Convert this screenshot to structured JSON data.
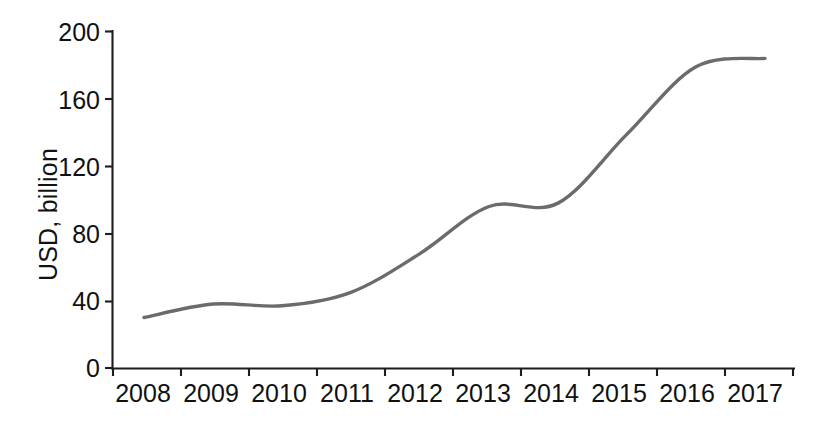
{
  "chart_data": {
    "type": "line",
    "title": "",
    "subtitle": "",
    "xlabel": "",
    "ylabel": "USD, billion",
    "categories": [
      "2008",
      "2009",
      "2010",
      "2011",
      "2012",
      "2013",
      "2014",
      "2015",
      "2016",
      "2017"
    ],
    "x": [
      2008,
      2009,
      2010,
      2011,
      2012,
      2013,
      2014,
      2015,
      2016,
      2017
    ],
    "values": [
      30,
      38,
      37,
      45,
      68,
      96,
      98,
      139,
      179,
      184
    ],
    "series": [
      {
        "name": "USD, billion",
        "values": [
          30,
          38,
          37,
          45,
          68,
          96,
          98,
          139,
          179,
          184
        ],
        "color": "#6b6b6b",
        "line_width": 3.4,
        "smooth": true,
        "markers": "none"
      }
    ],
    "ylim": [
      0,
      200
    ],
    "yticks": [
      0,
      40,
      80,
      120,
      160,
      200
    ],
    "ytick_labels": [
      "0",
      "40",
      "80",
      "120",
      "160",
      "200"
    ],
    "xtick_labels": [
      "2008",
      "2009",
      "2010",
      "2011",
      "2012",
      "2013",
      "2014",
      "2015",
      "2016",
      "2017"
    ],
    "grid": false,
    "legend": false,
    "legend_position": "none",
    "annotations": [],
    "axis_color": "#1d1d1d",
    "background": "#ffffff"
  },
  "axes": {
    "y_title": "USD, billion"
  }
}
